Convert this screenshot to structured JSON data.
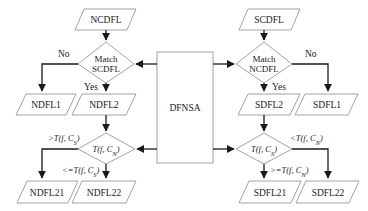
{
  "diagram": {
    "center": {
      "label": "DFNSA"
    },
    "left": {
      "input": "NCDFL",
      "decision1": {
        "line1": "Match",
        "line2": "SCDFL",
        "no": "No",
        "yes": "Yes"
      },
      "out1": "NDFL1",
      "out2": "NDFL2",
      "decision2": {
        "label": "T(f, C_N)",
        "branch_left": ">T(f, C_S)",
        "branch_down": "<=T(f, C_S)"
      },
      "out21": "NDFL21",
      "out22": "NDFL22"
    },
    "right": {
      "input": "SCDFL",
      "decision1": {
        "line1": "Match",
        "line2": "NCDFL",
        "no": "No",
        "yes": "Yes"
      },
      "out1": "SDFL1",
      "out2": "SDFL2",
      "decision2": {
        "label": "T(f, C_S)",
        "branch_right": "<T(f, C_N)",
        "branch_down": ">=T(f, C_N)"
      },
      "out21": "SDFL21",
      "out22": "SDFL22"
    },
    "colors": {
      "stroke": "#8a8a8a",
      "edge": "#1a1a1a",
      "background": "#ffffff"
    }
  }
}
